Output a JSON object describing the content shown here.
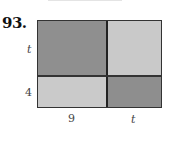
{
  "problem_number": "93.",
  "figure": {
    "colors": {
      "dark": "#8f8f8f",
      "light": "#c9c9c9",
      "border": "#333333"
    },
    "cells": [
      {
        "position": "top-left",
        "shade": "dark"
      },
      {
        "position": "top-right",
        "shade": "light"
      },
      {
        "position": "bottom-left",
        "shade": "light"
      },
      {
        "position": "bottom-right",
        "shade": "dark"
      }
    ],
    "labels": {
      "left_top": "t",
      "left_bottom": "4",
      "bottom_left": "9",
      "bottom_right": "t"
    }
  }
}
